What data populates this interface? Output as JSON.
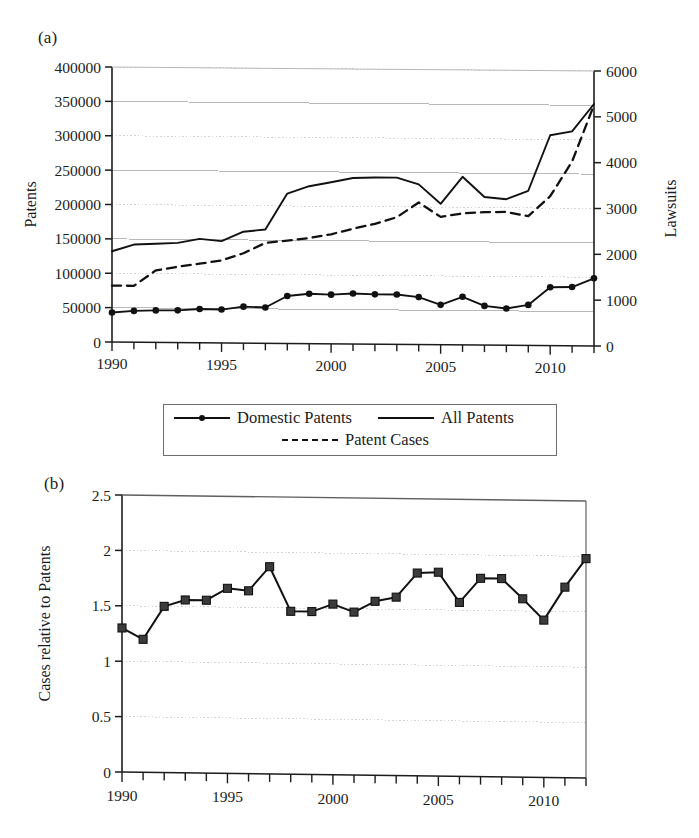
{
  "figure": {
    "panel_a_label": "(a)",
    "panel_b_label": "(b)"
  },
  "legend": {
    "items": [
      {
        "key": "domestic",
        "label": "Domestic Patents",
        "style": "line-marker"
      },
      {
        "key": "all",
        "label": "All Patents",
        "style": "line"
      },
      {
        "key": "cases",
        "label": "Patent Cases",
        "style": "dashed"
      }
    ]
  },
  "chart_data": [
    {
      "id": "panel-a",
      "type": "line",
      "title": "(a)",
      "xlabel": "",
      "ylabel": "Patents",
      "y2label": "Lawsuits",
      "xlim": [
        1990,
        2012
      ],
      "ylim": [
        0,
        400000
      ],
      "y2lim": [
        0,
        6000
      ],
      "yticks": [
        0,
        50000,
        100000,
        150000,
        200000,
        250000,
        300000,
        350000,
        400000
      ],
      "yticklabels": [
        "0",
        "50000",
        "100000",
        "150000",
        "200000",
        "250000",
        "300000",
        "350000",
        "400000"
      ],
      "y2ticks": [
        0,
        1000,
        2000,
        3000,
        4000,
        5000,
        6000
      ],
      "y2ticklabels": [
        "0",
        "1000",
        "2000",
        "3000",
        "4000",
        "5000",
        "6000"
      ],
      "xticks": [
        1990,
        1995,
        2000,
        2005,
        2010
      ],
      "xticklabels": [
        "1990",
        "1995",
        "2000",
        "2005",
        "2010"
      ],
      "xminorticks": [
        1990,
        1991,
        1992,
        1993,
        1994,
        1995,
        1996,
        1997,
        1998,
        1999,
        2000,
        2001,
        2002,
        2003,
        2004,
        2005,
        2006,
        2007,
        2008,
        2009,
        2010,
        2011,
        2012
      ],
      "grid": true,
      "legend_position": "below",
      "x": [
        1990,
        1991,
        1992,
        1993,
        1994,
        1995,
        1996,
        1997,
        1998,
        1999,
        2000,
        2001,
        2002,
        2003,
        2004,
        2005,
        2006,
        2007,
        2008,
        2009,
        2010,
        2011,
        2012
      ],
      "series": [
        {
          "name": "Domestic Patents",
          "axis": "left",
          "style": "solid-marker",
          "values": [
            43000,
            45500,
            46500,
            46800,
            49000,
            48500,
            53000,
            52000,
            69000,
            72500,
            71500,
            73500,
            72500,
            72500,
            69000,
            58000,
            70000,
            57000,
            53500,
            59000,
            85000,
            85500,
            98500
          ]
        },
        {
          "name": "All Patents",
          "axis": "left",
          "style": "solid",
          "values": [
            132000,
            142000,
            143500,
            145000,
            151000,
            148000,
            162000,
            165500,
            218000,
            229000,
            235000,
            241500,
            242500,
            242500,
            233000,
            205000,
            244500,
            215500,
            212500,
            225000,
            306000,
            312000,
            352000
          ]
        },
        {
          "name": "Patent Cases",
          "axis": "right",
          "style": "dashed",
          "values": [
            1230,
            1230,
            1570,
            1655,
            1725,
            1800,
            1960,
            2190,
            2245,
            2305,
            2390,
            2515,
            2625,
            2775,
            3100,
            2790,
            2870,
            2900,
            2910,
            2820,
            3260,
            4020,
            5260
          ]
        }
      ]
    },
    {
      "id": "panel-b",
      "type": "line",
      "title": "(b)",
      "xlabel": "",
      "ylabel": "Cases relative to Patents",
      "xlim": [
        1990,
        2012
      ],
      "ylim": [
        0,
        2.5
      ],
      "yticks": [
        0,
        0.5,
        1,
        1.5,
        2,
        2.5
      ],
      "yticklabels": [
        "0",
        "0.5",
        "1",
        "1.5",
        "2",
        "2.5"
      ],
      "xticks": [
        1990,
        1995,
        2000,
        2005,
        2010
      ],
      "xticklabels": [
        "1990",
        "1995",
        "2000",
        "2005",
        "2010"
      ],
      "xminorticks": [
        1990,
        1991,
        1992,
        1993,
        1994,
        1995,
        1996,
        1997,
        1998,
        1999,
        2000,
        2001,
        2002,
        2003,
        2004,
        2005,
        2006,
        2007,
        2008,
        2009,
        2010,
        2011,
        2012
      ],
      "grid": true,
      "x": [
        1990,
        1991,
        1992,
        1993,
        1994,
        1995,
        1996,
        1997,
        1998,
        1999,
        2000,
        2001,
        2002,
        2003,
        2004,
        2005,
        2006,
        2007,
        2008,
        2009,
        2010,
        2011,
        2012
      ],
      "series": [
        {
          "name": "Cases relative to Patents",
          "axis": "left",
          "style": "solid-square",
          "values": [
            1.3,
            1.2,
            1.5,
            1.56,
            1.56,
            1.67,
            1.65,
            1.87,
            1.47,
            1.47,
            1.54,
            1.47,
            1.57,
            1.61,
            1.83,
            1.84,
            1.57,
            1.79,
            1.79,
            1.61,
            1.42,
            1.72,
            1.98
          ]
        }
      ]
    }
  ]
}
